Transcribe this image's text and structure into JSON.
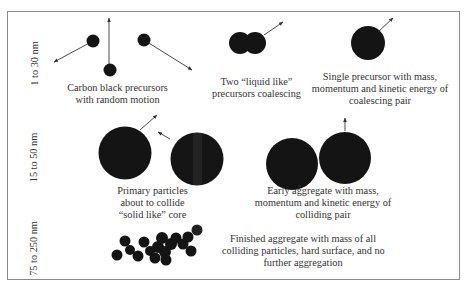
{
  "figure": {
    "rows": [
      {
        "size_label": "1 to 30 nm",
        "stages": [
          {
            "caption_lines": [
              "Carbon black precursors",
              "with random motion"
            ]
          },
          {
            "caption_lines": [
              "Two “liquid like”",
              "precursors coalescing"
            ]
          },
          {
            "caption_lines": [
              "Single precursor with mass,",
              "momentum and kinetic energy of",
              "coalescing pair"
            ]
          }
        ]
      },
      {
        "size_label": "15 to 50 nm",
        "stages": [
          {
            "caption_lines": [
              "Primary particles",
              "about to collide",
              "“solid like” core"
            ]
          },
          {
            "caption_lines": [
              "Early aggregate with mass,",
              "momentum and kinetic energy of",
              "colliding pair"
            ]
          }
        ]
      },
      {
        "size_label": "75 to 250 nm",
        "stages": [
          {
            "caption_lines": [
              "Finished aggregate with mass of all",
              "colliding particles, hard surface, and no",
              "further aggregation"
            ]
          }
        ]
      }
    ],
    "colors": {
      "particle": "#141414",
      "arrow": "#333333",
      "border": "#8a8a8a",
      "text": "#333333"
    }
  }
}
